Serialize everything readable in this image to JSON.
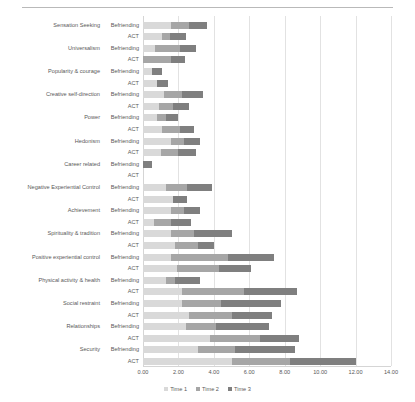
{
  "chart_data": {
    "type": "bar",
    "orientation": "horizontal",
    "stacked": true,
    "title": "",
    "xlabel": "",
    "ylabel": "",
    "xlim": [
      0,
      14
    ],
    "xticks": [
      0,
      2,
      4,
      6,
      8,
      10,
      12,
      14
    ],
    "xtick_labels": [
      "0.00",
      "2.00",
      "4.00",
      "6.00",
      "8.00",
      "10.00",
      "12.00",
      "14.00"
    ],
    "grid": true,
    "legend_position": "bottom",
    "legend": [
      "Time 1",
      "Time 2",
      "Time 3"
    ],
    "series": [
      {
        "name": "Time 1",
        "color": "#d9d9d9"
      },
      {
        "name": "Time 2",
        "color": "#a6a6a6"
      },
      {
        "name": "Time 3",
        "color": "#7f7f7f"
      }
    ],
    "categories": [
      "Sensation Seeking",
      "Universalism",
      "Popularity & courage",
      "Creative self-direction",
      "Power",
      "Hedonism",
      "Career related",
      "Negative Experiential Control",
      "Achievement",
      "Spirituality & tradition",
      "Positive experiential control",
      "Physical activity & health",
      "Social restraint",
      "Relationships",
      "Security"
    ],
    "groups": [
      "Befriending",
      "ACT"
    ],
    "rows": [
      {
        "category": "Sensation Seeking",
        "group": "Befriending",
        "values": [
          1.6,
          1.0,
          1.0
        ]
      },
      {
        "category": "Sensation Seeking",
        "group": "ACT",
        "values": [
          1.1,
          0.4,
          0.9
        ]
      },
      {
        "category": "Universalism",
        "group": "Befriending",
        "values": [
          0.7,
          1.4,
          0.9
        ]
      },
      {
        "category": "Universalism",
        "group": "ACT",
        "values": [
          0.0,
          1.6,
          0.8
        ]
      },
      {
        "category": "Popularity & courage",
        "group": "Befriending",
        "values": [
          0.5,
          0.0,
          0.6
        ]
      },
      {
        "category": "Popularity & courage",
        "group": "ACT",
        "values": [
          0.8,
          0.0,
          0.6
        ]
      },
      {
        "category": "Creative self-direction",
        "group": "Befriending",
        "values": [
          1.2,
          1.0,
          1.2
        ]
      },
      {
        "category": "Creative self-direction",
        "group": "ACT",
        "values": [
          0.9,
          0.8,
          0.9
        ]
      },
      {
        "category": "Power",
        "group": "Befriending",
        "values": [
          0.8,
          0.5,
          0.7
        ]
      },
      {
        "category": "Power",
        "group": "ACT",
        "values": [
          1.1,
          1.0,
          0.8
        ]
      },
      {
        "category": "Hedonism",
        "group": "Befriending",
        "values": [
          1.6,
          0.7,
          0.9
        ]
      },
      {
        "category": "Hedonism",
        "group": "ACT",
        "values": [
          1.0,
          1.0,
          1.0
        ]
      },
      {
        "category": "Career related",
        "group": "Befriending",
        "values": [
          0.0,
          0.0,
          0.5
        ]
      },
      {
        "category": "Career related",
        "group": "ACT",
        "values": [
          0.0,
          0.0,
          0.0
        ]
      },
      {
        "category": "Negative Experiential Control",
        "group": "Befriending",
        "values": [
          1.3,
          1.2,
          1.4
        ]
      },
      {
        "category": "Negative Experiential Control",
        "group": "ACT",
        "values": [
          1.7,
          0.0,
          0.8
        ]
      },
      {
        "category": "Achievement",
        "group": "Befriending",
        "values": [
          1.6,
          0.7,
          0.9
        ]
      },
      {
        "category": "Achievement",
        "group": "ACT",
        "values": [
          0.6,
          1.0,
          1.1
        ]
      },
      {
        "category": "Spirituality & tradition",
        "group": "Befriending",
        "values": [
          1.6,
          1.3,
          2.1
        ]
      },
      {
        "category": "Spirituality & tradition",
        "group": "ACT",
        "values": [
          1.8,
          1.3,
          0.9
        ]
      },
      {
        "category": "Positive experiential control",
        "group": "Befriending",
        "values": [
          1.6,
          3.2,
          2.6
        ]
      },
      {
        "category": "Positive experiential control",
        "group": "ACT",
        "values": [
          1.9,
          2.4,
          1.8
        ]
      },
      {
        "category": "Physical activity & health",
        "group": "Befriending",
        "values": [
          1.3,
          0.5,
          1.4
        ]
      },
      {
        "category": "Physical activity & health",
        "group": "ACT",
        "values": [
          2.2,
          3.5,
          3.0
        ]
      },
      {
        "category": "Social restraint",
        "group": "Befriending",
        "values": [
          2.2,
          2.2,
          3.4
        ]
      },
      {
        "category": "Social restraint",
        "group": "ACT",
        "values": [
          2.6,
          2.4,
          2.3
        ]
      },
      {
        "category": "Relationships",
        "group": "Befriending",
        "values": [
          2.4,
          1.7,
          3.0
        ]
      },
      {
        "category": "Relationships",
        "group": "ACT",
        "values": [
          3.8,
          2.8,
          2.2
        ]
      },
      {
        "category": "Security",
        "group": "Befriending",
        "values": [
          3.1,
          2.1,
          3.4
        ]
      },
      {
        "category": "Security",
        "group": "ACT",
        "values": [
          5.0,
          3.3,
          3.7
        ]
      }
    ]
  }
}
